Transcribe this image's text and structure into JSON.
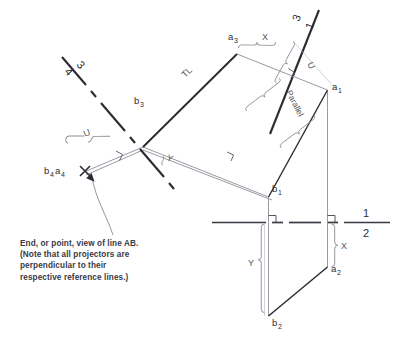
{
  "figure": {
    "background_color": "#ffffff",
    "heavy_line_color": "#2b2b33",
    "light_line_color": "#9a9aa4",
    "dim_line_color": "#8a8a95"
  },
  "fold_lines": [
    {
      "name": "fold-4-3",
      "upper_label": "4",
      "lower_label": "3",
      "style": "dash-dot"
    },
    {
      "name": "fold-3-1",
      "upper_label": "3",
      "lower_label": "1",
      "style": "solid"
    },
    {
      "name": "fold-1-2",
      "upper_label": "1",
      "lower_label": "2",
      "style": "solid-dashed"
    }
  ],
  "points": [
    {
      "name": "a3",
      "letter": "a",
      "sub": "3"
    },
    {
      "name": "b3",
      "letter": "b",
      "sub": "3"
    },
    {
      "name": "a1",
      "letter": "a",
      "sub": "1"
    },
    {
      "name": "b1",
      "letter": "b",
      "sub": "1"
    },
    {
      "name": "a2",
      "letter": "a",
      "sub": "2"
    },
    {
      "name": "b2",
      "letter": "b",
      "sub": "2"
    },
    {
      "name": "b4a4",
      "letter": "b",
      "sub": "4",
      "letter2": "a",
      "sub2": "4"
    }
  ],
  "dimensions": [
    {
      "name": "dim-x-top",
      "label": "X"
    },
    {
      "name": "dim-u-top",
      "label": "U"
    },
    {
      "name": "dim-u-left",
      "label": "U"
    },
    {
      "name": "dim-y-middle",
      "label": "Y"
    },
    {
      "name": "dim-x-bottom",
      "label": "X"
    },
    {
      "name": "dim-y-bottom",
      "label": "Y"
    }
  ],
  "annotations": [
    {
      "name": "true-length-label",
      "label": "TL"
    },
    {
      "name": "parallel-label",
      "label": "Parallel"
    }
  ],
  "caption": {
    "line1": "End, or point, view of line AB.",
    "line2": "(Note that all projectors are",
    "line3": "perpendicular to their",
    "line4": "respective reference lines.)"
  }
}
